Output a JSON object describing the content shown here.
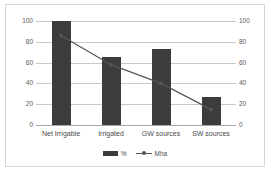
{
  "chart_data": {
    "type": "bar",
    "title": "",
    "subtitle": "",
    "xlabel": "",
    "ylabel": "",
    "y2label": "",
    "categories": [
      "Net Irrigable",
      "Irrigated",
      "GW sources",
      "SW sources"
    ],
    "yticks": [
      0,
      20,
      40,
      60,
      80,
      100
    ],
    "y2ticks": [
      0,
      20,
      40,
      60,
      80,
      100
    ],
    "ylim": [
      0,
      100
    ],
    "y2lim": [
      0,
      100
    ],
    "grid": true,
    "legend_position": "bottom",
    "series": [
      {
        "name": "%",
        "type": "bar",
        "axis": "left",
        "color": "#3c3c3c",
        "values": [
          100,
          65,
          73,
          27
        ]
      },
      {
        "name": "Mha",
        "type": "line",
        "axis": "right",
        "color": "#555555",
        "values": [
          86,
          58,
          40,
          15
        ]
      }
    ]
  },
  "legend": {
    "items": [
      {
        "label": "%"
      },
      {
        "label": "Mha"
      }
    ]
  },
  "colors": {
    "bar": "#3c3c3c",
    "line": "#555555",
    "grid": "#c8c8c8",
    "border": "#d6d6d6",
    "text": "#4a4a4a",
    "background": "#ffffff"
  }
}
